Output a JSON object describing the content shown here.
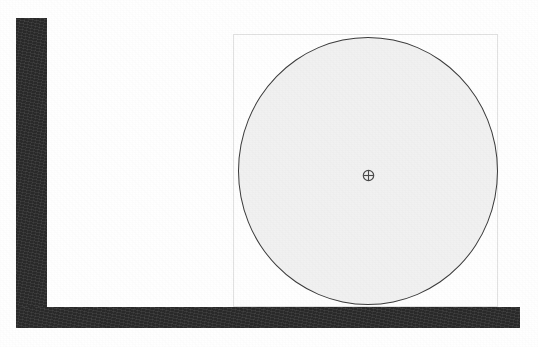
{
  "scene": {
    "title": "Wheel resting against wall and floor",
    "canvas": {
      "width": 538,
      "height": 347,
      "background_color": "#ffffff"
    },
    "objects": [
      {
        "name": "wall",
        "kind": "rig-vertical-bar",
        "color": "#2e2e2e",
        "x": 16,
        "y": 18,
        "width": 31,
        "height": 290
      },
      {
        "name": "floor",
        "kind": "rig-horizontal-bar",
        "color": "#2e2e2e",
        "x": 16,
        "y": 307,
        "width": 504,
        "height": 21
      },
      {
        "name": "wheel",
        "kind": "circle",
        "fill_color": "#f1f1f1",
        "stroke_color": "#3a3a3a",
        "cx": 368,
        "cy": 171,
        "rx": 130,
        "ry": 134
      },
      {
        "name": "bounding-box",
        "kind": "rectangle",
        "stroke_color": "#e2e2e2",
        "x": 233,
        "y": 34,
        "width": 265,
        "height": 273
      },
      {
        "name": "center-marker",
        "kind": "crosshair-in-circle",
        "color": "#4a4a4a",
        "cx": 368,
        "cy": 175,
        "size": 13
      }
    ]
  },
  "annotations": {
    "bbox_label": "",
    "center_label": ""
  }
}
